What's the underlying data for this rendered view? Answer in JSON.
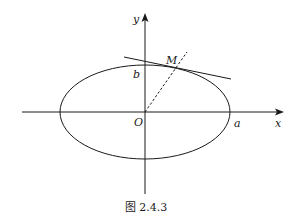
{
  "figure": {
    "caption": "图 2.4.3",
    "labels": {
      "x_axis": "x",
      "y_axis": "y",
      "origin": "O",
      "semi_major": "a",
      "semi_minor": "b",
      "point": "M"
    },
    "elements": [
      {
        "type": "axis",
        "name": "x-axis",
        "direction": "horizontal",
        "arrow": true
      },
      {
        "type": "axis",
        "name": "y-axis",
        "direction": "vertical",
        "arrow": true
      },
      {
        "type": "ellipse",
        "name": "ellipse",
        "center": "O",
        "semi_major_label": "a",
        "semi_minor_label": "b"
      },
      {
        "type": "line",
        "name": "tangent-line",
        "touches": "M"
      },
      {
        "type": "dashed-line",
        "name": "segment-OM",
        "from": "O",
        "through": "M"
      }
    ],
    "colors": {
      "stroke": "#1a1a1a",
      "background": "#ffffff"
    }
  }
}
